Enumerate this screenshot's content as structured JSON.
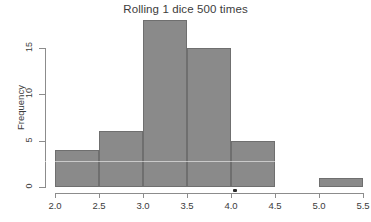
{
  "chart_data": {
    "type": "bar",
    "title": "Rolling 1 dice 500 times",
    "xlabel": "",
    "ylabel": "Frequency",
    "xlim": [
      2.0,
      5.5
    ],
    "ylim": [
      0,
      18
    ],
    "grid": false,
    "legend": null,
    "bin_width": 0.5,
    "bin_edges": [
      2.0,
      2.5,
      3.0,
      3.5,
      4.0,
      4.5,
      5.0,
      5.5
    ],
    "categories": [
      "2.0-2.5",
      "2.5-3.0",
      "3.0-3.5",
      "3.5-4.0",
      "4.0-4.5",
      "4.5-5.0",
      "5.0-5.5"
    ],
    "values": [
      4,
      6,
      18,
      15,
      5,
      0,
      1
    ],
    "bars": [
      {
        "x0": 2.0,
        "x1": 2.5,
        "value": 4
      },
      {
        "x0": 2.5,
        "x1": 3.0,
        "value": 6
      },
      {
        "x0": 3.0,
        "x1": 3.5,
        "value": 18
      },
      {
        "x0": 3.5,
        "x1": 4.0,
        "value": 15
      },
      {
        "x0": 4.0,
        "x1": 4.5,
        "value": 5
      },
      {
        "x0": 4.5,
        "x1": 5.0,
        "value": 0
      },
      {
        "x0": 5.0,
        "x1": 5.5,
        "value": 1
      }
    ],
    "xticks": [
      "2.0",
      "2.5",
      "3.0",
      "3.5",
      "4.0",
      "4.5",
      "5.0",
      "5.5"
    ],
    "xtick_values": [
      2.0,
      2.5,
      3.0,
      3.5,
      4.0,
      4.5,
      5.0,
      5.5
    ],
    "yticks": [
      "0",
      "5",
      "10",
      "15"
    ],
    "ytick_values": [
      0,
      5,
      10,
      15
    ],
    "colors": {
      "bar_fill": "#8a8a8a",
      "bar_border": "#6f6f6f",
      "axis": "#8c8c8c",
      "text": "#3c3c3c",
      "background": "#ffffff"
    }
  }
}
